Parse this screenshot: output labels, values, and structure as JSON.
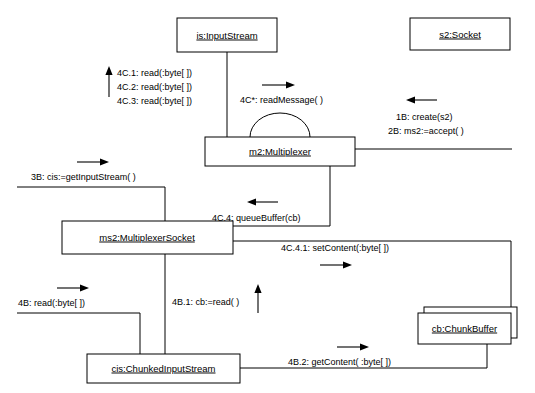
{
  "diagram": {
    "objects": [
      {
        "id": "is",
        "label": "is:InputStream"
      },
      {
        "id": "s2",
        "label": "s2:Socket"
      },
      {
        "id": "m2",
        "label": "m2:Multiplexer"
      },
      {
        "id": "ms2",
        "label": "ms2:MultiplexerSocket"
      },
      {
        "id": "cb",
        "label": "cb:ChunkBuffer"
      },
      {
        "id": "cis",
        "label": "cis:ChunkedInputStream"
      }
    ],
    "messages": {
      "read_1": "4C.1: read(:byte[ ])",
      "read_2": "4C.2: read(:byte[ ])",
      "read_3": "4C.3: read(:byte[ ])",
      "read_message": "4C*: readMessage( )",
      "create_s2": "1B: create(s2)",
      "accept": "2B: ms2:=accept( )",
      "get_input_stream": "3B: cis:=getInputStream( )",
      "queue_buffer": "4C.4: queueBuffer(cb)",
      "set_content": "4C.4.1: setContent(:byte[ ])",
      "read_byte": "4B: read(:byte[ ])",
      "cb_read": "4B.1: cb:=read( )",
      "get_content": "4B.2: getContent( :byte[ ])"
    },
    "colors": {
      "stroke": "#000000",
      "fill": "#ffffff",
      "text": "#000000"
    }
  }
}
